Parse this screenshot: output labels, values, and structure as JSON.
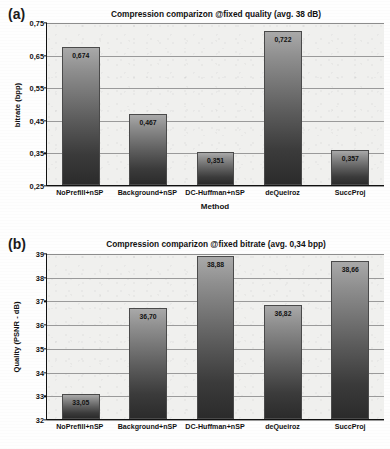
{
  "figure": {
    "panels": [
      {
        "letter": "(a)",
        "title": "Compression comparizon @fixed quality (avg. 38 dB)",
        "ylabel": "bitrate (bpp)",
        "xlabel": "Method",
        "yticks": [
          "0,75",
          "0,65",
          "0,55",
          "0,45",
          "0,35",
          "0,25"
        ],
        "categories": [
          "NoPrefill+nSP",
          "Background+nSP",
          "DC-Huffman+nSP",
          "deQueiroz",
          "SuccProj"
        ],
        "value_labels": [
          "0,674",
          "0,467",
          "0,351",
          "0,722",
          "0,357"
        ]
      },
      {
        "letter": "(b)",
        "title": "Compression comparizon @fixed bitrate (avg. 0,34 bpp)",
        "ylabel": "Quality (PSNR - dB)",
        "xlabel": "",
        "yticks": [
          "39",
          "38",
          "37",
          "36",
          "35",
          "34",
          "33",
          "32"
        ],
        "categories": [
          "NoPrefill+nSP",
          "Background+nSP",
          "DC-Huffman+nSP",
          "deQueiroz",
          "SuccProj"
        ],
        "value_labels": [
          "33,05",
          "36,70",
          "38,88",
          "36,82",
          "38,66"
        ]
      }
    ]
  },
  "chart_data": [
    {
      "type": "bar",
      "title": "Compression comparizon @fixed quality (avg. 38 dB)",
      "xlabel": "Method",
      "ylabel": "bitrate (bpp)",
      "categories": [
        "NoPrefill+nSP",
        "Background+nSP",
        "DC-Huffman+nSP",
        "deQueiroz",
        "SuccProj"
      ],
      "values": [
        0.674,
        0.467,
        0.351,
        0.722,
        0.357
      ],
      "data_labels": [
        "0,674",
        "0,467",
        "0,351",
        "0,722",
        "0,357"
      ],
      "ylim": [
        0.25,
        0.75
      ],
      "ytick_values": [
        0.75,
        0.65,
        0.55,
        0.45,
        0.35,
        0.25
      ],
      "ytick_labels": [
        "0,75",
        "0,65",
        "0,55",
        "0,45",
        "0,35",
        "0,25"
      ],
      "grid": true,
      "legend": "none"
    },
    {
      "type": "bar",
      "title": "Compression comparizon @fixed bitrate (avg. 0,34 bpp)",
      "xlabel": "",
      "ylabel": "Quality (PSNR - dB)",
      "categories": [
        "NoPrefill+nSP",
        "Background+nSP",
        "DC-Huffman+nSP",
        "deQueiroz",
        "SuccProj"
      ],
      "values": [
        33.05,
        36.7,
        38.88,
        36.82,
        38.66
      ],
      "data_labels": [
        "33,05",
        "36,70",
        "38,88",
        "36,82",
        "38,66"
      ],
      "ylim": [
        32,
        39
      ],
      "ytick_values": [
        39,
        38,
        37,
        36,
        35,
        34,
        33,
        32
      ],
      "ytick_labels": [
        "39",
        "38",
        "37",
        "36",
        "35",
        "34",
        "33",
        "32"
      ],
      "grid": true,
      "legend": "none"
    }
  ]
}
